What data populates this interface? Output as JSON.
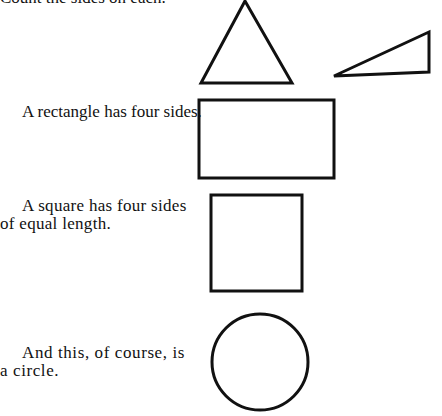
{
  "page": {
    "intro": "Count the sides on each.",
    "rectangle_text": "A rectangle has four sides.",
    "square_text": "A square has four sides of equal length.",
    "circle_text": "And this, of course, is a circle."
  },
  "shapes": {
    "triangle_equilateral": "triangle",
    "triangle_right": "right triangle",
    "rectangle": "rectangle",
    "square": "square",
    "circle": "circle"
  }
}
